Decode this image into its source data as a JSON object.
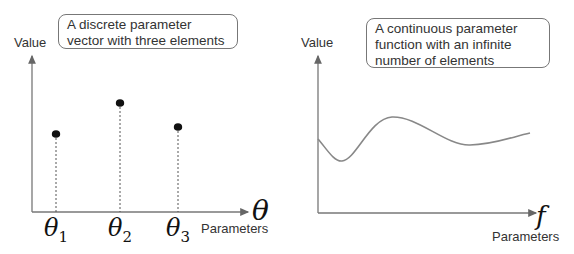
{
  "left_panel": {
    "callout": "A discrete parameter vector with three elements",
    "y_axis_label": "Value",
    "x_axis_symbol": "θ",
    "x_axis_label": "Parameters",
    "points": [
      {
        "label_base": "θ",
        "label_sub": "1"
      },
      {
        "label_base": "θ",
        "label_sub": "2"
      },
      {
        "label_base": "θ",
        "label_sub": "3"
      }
    ]
  },
  "right_panel": {
    "callout": "A continuous parameter function with an infinite number of elements",
    "y_axis_label": "Value",
    "x_axis_symbol": "f",
    "x_axis_label": "Parameters"
  },
  "colors": {
    "axis": "#777777",
    "point": "#111111",
    "curve": "#888888",
    "callout_border": "#777777"
  }
}
